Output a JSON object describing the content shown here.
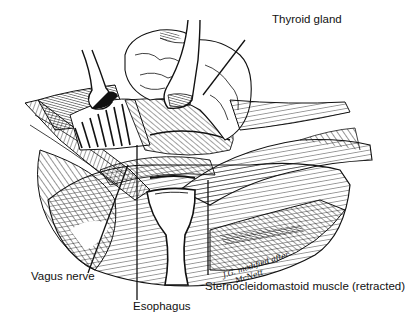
{
  "figure": {
    "colors": {
      "ink": "#111111",
      "background": "#ffffff"
    }
  },
  "labels": {
    "thyroid": "Thyroid gland",
    "vagus": "Vagus nerve",
    "esophagus": "Esophagus",
    "scm": "Sternocleidomastoid muscle (retracted)"
  },
  "signature": {
    "line1": "J.G. modified after",
    "line2": "McNett"
  }
}
